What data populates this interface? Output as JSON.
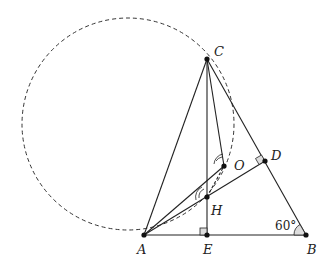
{
  "diagram": {
    "points": {
      "A": {
        "label": "A",
        "x": 144,
        "y": 235
      },
      "B": {
        "label": "B",
        "x": 306,
        "y": 235
      },
      "C": {
        "label": "C",
        "x": 207,
        "y": 59
      },
      "D": {
        "label": "D",
        "x": 265,
        "y": 161
      },
      "E": {
        "label": "E",
        "x": 207,
        "y": 235
      },
      "H": {
        "label": "H",
        "x": 207,
        "y": 197
      },
      "O": {
        "label": "O",
        "x": 224,
        "y": 166
      }
    },
    "angle_label": "60°",
    "circle": {
      "style": "dashed",
      "through": [
        "A",
        "C",
        "H",
        "O"
      ]
    },
    "right_angles": [
      "E",
      "D"
    ],
    "segments": [
      "AB",
      "BC",
      "CA",
      "CE",
      "AD",
      "AO",
      "CO",
      "HO"
    ]
  }
}
